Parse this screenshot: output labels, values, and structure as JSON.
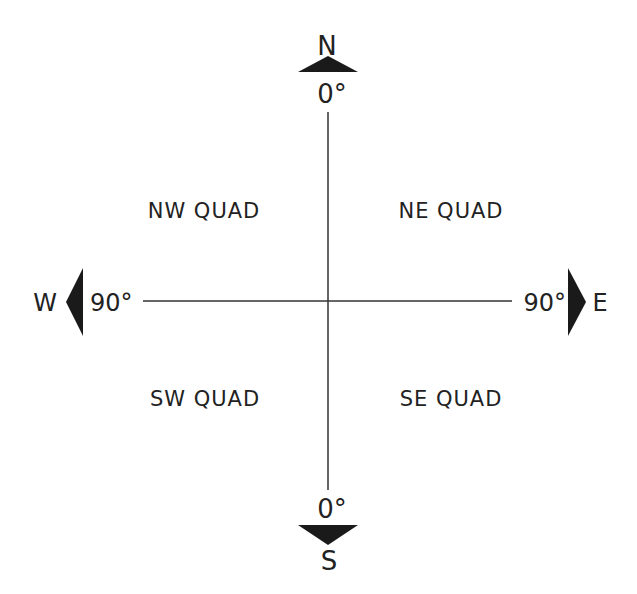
{
  "diagram": {
    "colors": {
      "line": "#333333",
      "text": "#222222",
      "arrow": "#1a1a1a",
      "background": "#ffffff"
    },
    "directions": {
      "north": {
        "letter": "N",
        "degree": "0°"
      },
      "south": {
        "letter": "S",
        "degree": "0°"
      },
      "east": {
        "letter": "E",
        "degree": "90°"
      },
      "west": {
        "letter": "W",
        "degree": "90°"
      }
    },
    "quadrants": {
      "nw": "NW QUAD",
      "ne": "NE QUAD",
      "sw": "SW QUAD",
      "se": "SE QUAD"
    }
  }
}
